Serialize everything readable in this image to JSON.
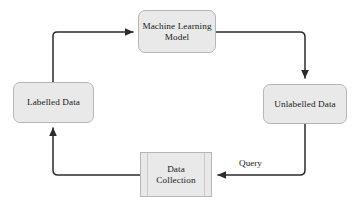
{
  "diagram": {
    "background_color": "#ffffff",
    "node_fill_color": "#e9e9e9",
    "node_border_color": "#b6b6b6",
    "edge_color": "#2b2b2b",
    "text_color": "#1a1a1a",
    "nodes": [
      {
        "id": "machine-learning-model",
        "label": "Machine Learning\nModel",
        "shape": "rounded-rectangle",
        "position": "top"
      },
      {
        "id": "unlabelled-data",
        "label": "Unlabelled Data",
        "shape": "rounded-rectangle",
        "position": "right"
      },
      {
        "id": "data-collection",
        "label": "Data\nCollection",
        "shape": "predefined-process",
        "position": "bottom"
      },
      {
        "id": "labelled-data",
        "label": "Labelled Data",
        "shape": "rounded-rectangle",
        "position": "left"
      }
    ],
    "edges": [
      {
        "id": "ml-to-unlabelled",
        "from": "machine-learning-model",
        "to": "unlabelled-data",
        "label": "",
        "style": "orthogonal-arrow"
      },
      {
        "id": "unlabelled-to-collection",
        "from": "unlabelled-data",
        "to": "data-collection",
        "label": "Query",
        "style": "orthogonal-arrow"
      },
      {
        "id": "collection-to-labelled",
        "from": "data-collection",
        "to": "labelled-data",
        "label": "",
        "style": "orthogonal-arrow"
      },
      {
        "id": "labelled-to-ml",
        "from": "labelled-data",
        "to": "machine-learning-model",
        "label": "",
        "style": "orthogonal-arrow"
      }
    ]
  }
}
